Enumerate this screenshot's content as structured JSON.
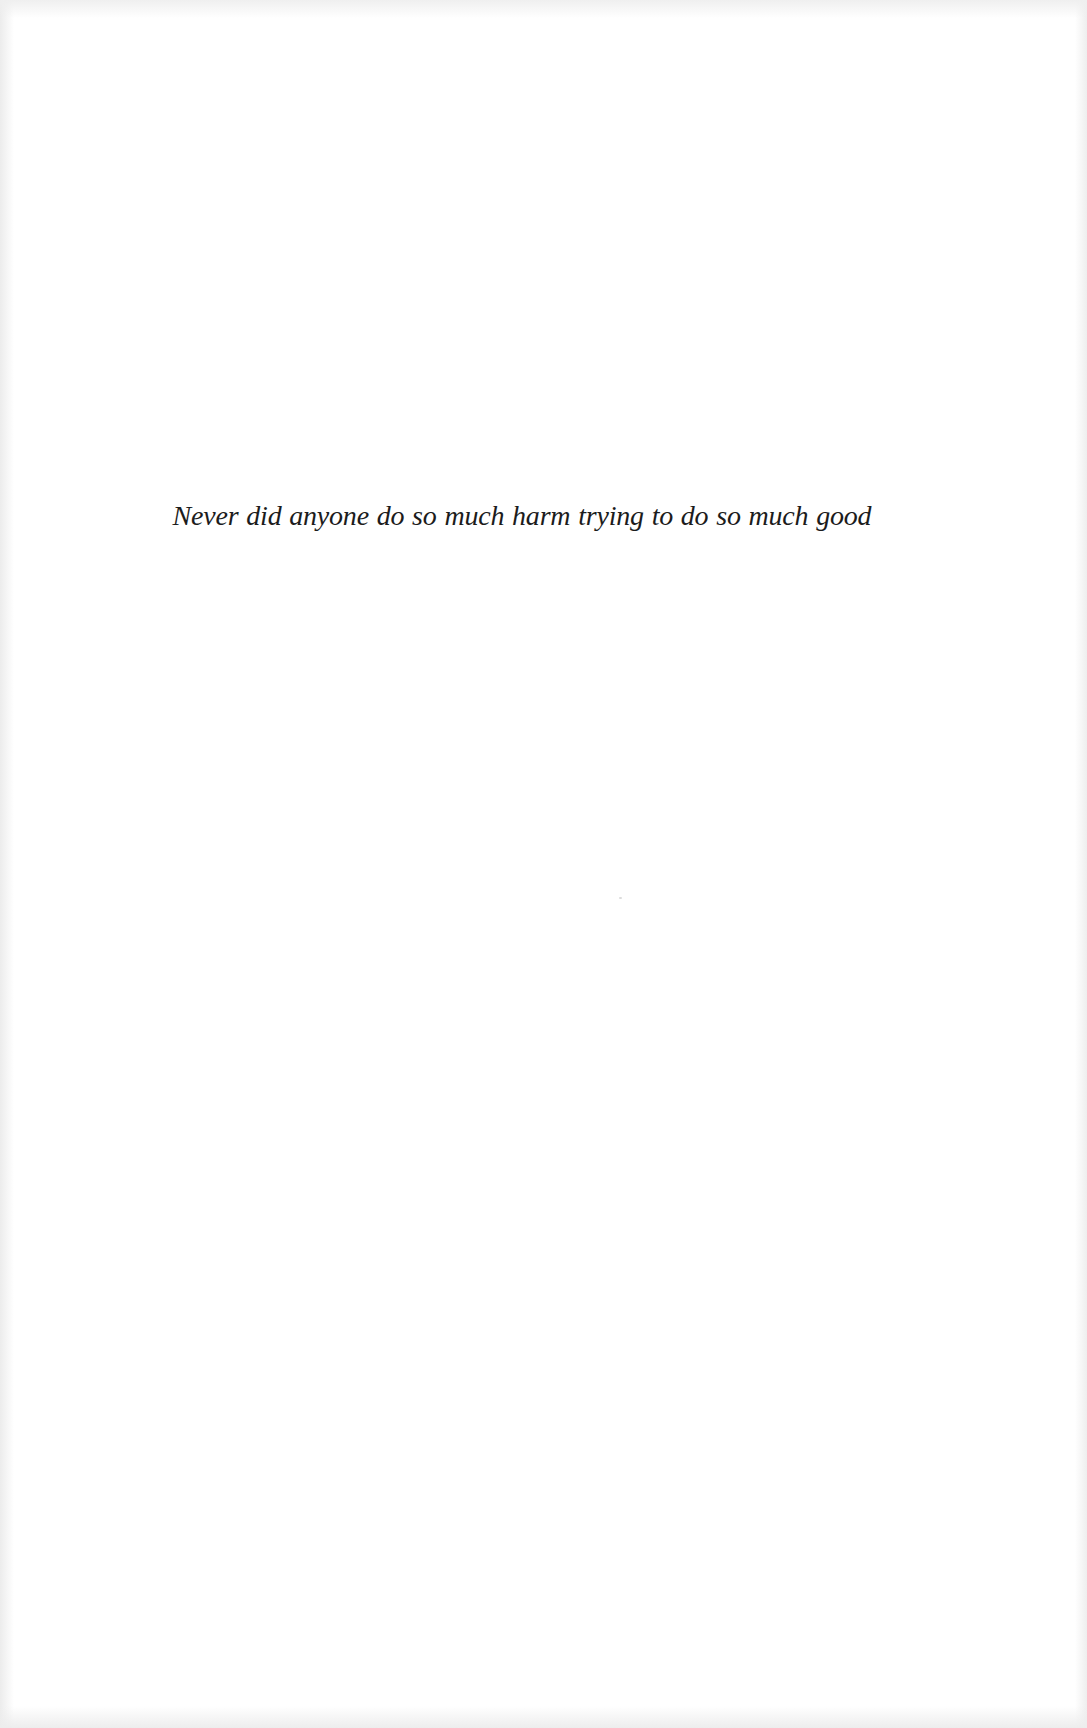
{
  "page": {
    "background_color": "#ffffff",
    "text_color": "#1c1c1c",
    "epigraph": {
      "text": "Never did anyone do so much harm trying to do so much good"
    }
  }
}
